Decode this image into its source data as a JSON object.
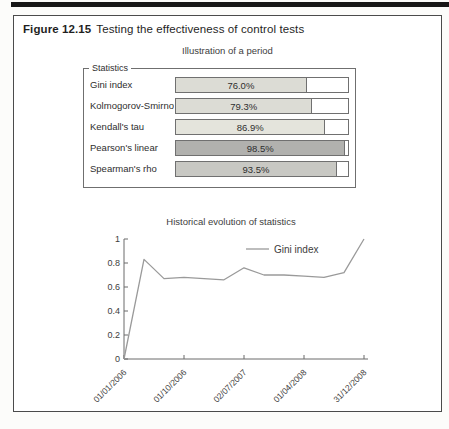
{
  "figure": {
    "label": "Figure 12.15",
    "title": "Testing the effectiveness of control tests"
  },
  "panel": {
    "subtitle": "Illustration of a period",
    "groupbox_label": "Statistics"
  },
  "chart_data": [
    {
      "type": "bar",
      "orientation": "horizontal",
      "title": "Illustration of a period",
      "group_label": "Statistics",
      "categories": [
        "Gini index",
        "Kolmogorov-Smirnov",
        "Kendall's tau",
        "Pearson's linear",
        "Spearman's rho"
      ],
      "values": [
        76.0,
        79.3,
        86.9,
        98.5,
        93.5
      ],
      "value_labels": [
        "76.0%",
        "79.3%",
        "86.9%",
        "98.5%",
        "93.5%"
      ],
      "bar_colors": [
        "#dcdcd5",
        "#dcdcd5",
        "#e4e4dc",
        "#b1b1ae",
        "#c8c8c3"
      ],
      "xlim": [
        0,
        100
      ]
    },
    {
      "type": "line",
      "title": "Historical evolution of statistics",
      "legend": [
        {
          "name": "Gini index",
          "color": "#9a9a9a"
        }
      ],
      "legend_position": "upper center-right",
      "grid": false,
      "ylim": [
        0,
        1
      ],
      "y_ticks": [
        "0",
        "0.2",
        "0.4",
        "0.6",
        "0.8",
        "1"
      ],
      "x_tick_labels": [
        "01/01/2006",
        "01/10/2006",
        "02/07/2007",
        "01/04/2008",
        "31/12/2008"
      ],
      "x_tick_indices": [
        0,
        3,
        6,
        9,
        12
      ],
      "series": [
        {
          "name": "Gini index",
          "values": [
            0,
            0.83,
            0.67,
            0.68,
            0.67,
            0.66,
            0.76,
            0.7,
            0.7,
            0.69,
            0.68,
            0.72,
            1.0
          ]
        }
      ],
      "line_color": "#9a9a9a",
      "axis_color": "#6b6b6b"
    }
  ]
}
